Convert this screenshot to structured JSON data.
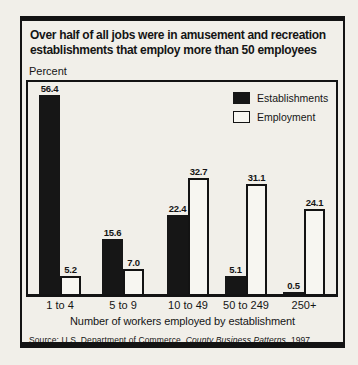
{
  "title_lines": [
    "Over half of all jobs were in amusement and recreation",
    "establishments that employ more than 50 employees"
  ],
  "y_axis_unit": "Percent",
  "legend": [
    {
      "label": "Establishments",
      "color": "#161616"
    },
    {
      "label": "Employment",
      "color": "#f7f6f1"
    }
  ],
  "x_axis_label": "Number of workers employed by establishment",
  "source": {
    "prefix": "Source: U.S. Department of Commerce, ",
    "italic": "County Business Patterns",
    "suffix": ", 1997"
  },
  "colors": {
    "background": "#f1efe9",
    "border": "#131313",
    "bar_black": "#161616",
    "bar_white": "#f7f6f1",
    "text": "#151515"
  },
  "chart_data": {
    "type": "bar",
    "title": "Over half of all jobs were in amusement and recreation establishments that employ more than 50 employees",
    "categories": [
      "1 to 4",
      "5 to 9",
      "10 to 49",
      "50 to 249",
      "250+"
    ],
    "series": [
      {
        "name": "Establishments",
        "values": [
          56.4,
          15.6,
          22.4,
          5.1,
          0.5
        ]
      },
      {
        "name": "Employment",
        "values": [
          5.2,
          7.0,
          32.7,
          31.1,
          24.1
        ]
      }
    ],
    "xlabel": "Number of workers employed by establishment",
    "ylabel": "Percent",
    "ylim": [
      0,
      60
    ],
    "grid": false,
    "legend_position": "top-right",
    "value_labels": true,
    "source": "Source: U.S. Department of Commerce, County Business Patterns, 1997"
  }
}
